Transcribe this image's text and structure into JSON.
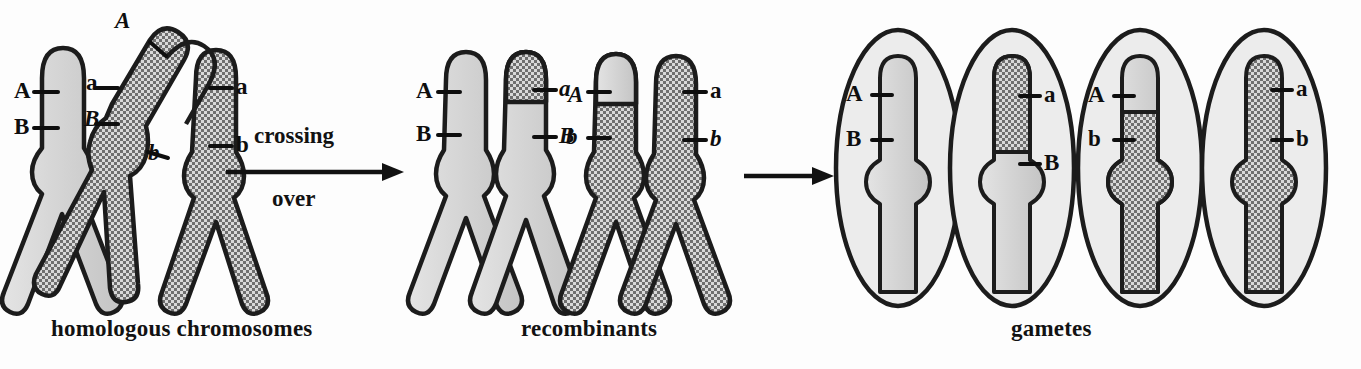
{
  "figure": {
    "background": "#fdfdfd",
    "outline_color": "#1c1c1c",
    "light_fill": "#d4d4d4",
    "dark_fill": "#a9a9a9",
    "cell_fill": "#ececec"
  },
  "captions": {
    "homologous": "homologous chromosomes",
    "recombinants": "recombinants",
    "gametes": "gametes"
  },
  "process_arrow": {
    "label_line1": "crossing",
    "label_line2": "over",
    "name": "crossing-over-arrow"
  },
  "second_arrow": {
    "label": ""
  },
  "panels": {
    "homologous": {
      "chromosomes": [
        {
          "id": "maternal-light",
          "shade": "light",
          "labels": [
            {
              "text": "A",
              "style": "upright",
              "side": "left"
            },
            {
              "text": "B",
              "style": "upright",
              "side": "left"
            },
            {
              "text": "a",
              "style": "upright",
              "side": "inner"
            },
            {
              "text": "B",
              "style": "italic",
              "side": "inner"
            }
          ]
        },
        {
          "id": "paternal-dark",
          "shade": "dark",
          "labels": [
            {
              "text": "A",
              "style": "italic",
              "side": "top"
            },
            {
              "text": "b",
              "style": "italic",
              "side": "inner"
            },
            {
              "text": "a",
              "style": "upright",
              "side": "right"
            },
            {
              "text": "b",
              "style": "upright",
              "side": "right"
            }
          ]
        }
      ]
    },
    "recombinants": {
      "chromosomes": [
        {
          "id": "recombinant-left",
          "shade": "light",
          "exchanged_tip": "dark",
          "labels": [
            {
              "text": "A",
              "style": "upright",
              "side": "left"
            },
            {
              "text": "B",
              "style": "upright",
              "side": "left"
            },
            {
              "text": "a",
              "style": "italic",
              "side": "right"
            },
            {
              "text": "B",
              "style": "italic",
              "side": "right"
            }
          ]
        },
        {
          "id": "recombinant-right",
          "shade": "dark",
          "exchanged_tip": "light",
          "labels": [
            {
              "text": "A",
              "style": "italic",
              "side": "left"
            },
            {
              "text": "b",
              "style": "italic",
              "side": "left"
            },
            {
              "text": "a",
              "style": "upright",
              "side": "right"
            },
            {
              "text": "b",
              "style": "italic",
              "side": "right"
            }
          ]
        }
      ]
    },
    "gametes": {
      "cells": [
        {
          "id": "gamete-1",
          "genotype": "A B",
          "chromatid_shade": "light",
          "tip_shade": "light",
          "labels": [
            {
              "text": "A",
              "side": "left"
            },
            {
              "text": "B",
              "side": "left"
            }
          ]
        },
        {
          "id": "gamete-2",
          "genotype": "a B",
          "chromatid_shade": "light",
          "tip_shade": "dark",
          "labels": [
            {
              "text": "a",
              "side": "right"
            },
            {
              "text": "B",
              "side": "right"
            }
          ]
        },
        {
          "id": "gamete-3",
          "genotype": "A b",
          "chromatid_shade": "dark",
          "tip_shade": "light",
          "labels": [
            {
              "text": "A",
              "side": "left"
            },
            {
              "text": "b",
              "side": "left"
            }
          ]
        },
        {
          "id": "gamete-4",
          "genotype": "a b",
          "chromatid_shade": "dark",
          "tip_shade": "dark",
          "labels": [
            {
              "text": "a",
              "side": "right"
            },
            {
              "text": "b",
              "side": "right"
            }
          ]
        }
      ]
    }
  }
}
